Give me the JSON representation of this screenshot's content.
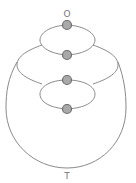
{
  "diagram": {
    "type": "graph",
    "source_label": "O",
    "target_label": "T",
    "nodes": [
      {
        "id": "n1",
        "x": 67,
        "y": 25
      },
      {
        "id": "n2",
        "x": 67,
        "y": 55
      },
      {
        "id": "n3",
        "x": 67,
        "y": 80
      },
      {
        "id": "n4",
        "x": 67,
        "y": 109
      }
    ],
    "edges": [
      {
        "from": "n1",
        "to": "n2",
        "shape": "upper-ellipse-left"
      },
      {
        "from": "n1",
        "to": "n2",
        "shape": "upper-ellipse-right"
      },
      {
        "from": "n1",
        "to": "n3",
        "shape": "middle-lobe-left"
      },
      {
        "from": "n1",
        "to": "n3",
        "shape": "middle-lobe-right"
      },
      {
        "from": "n3",
        "to": "n4",
        "shape": "lower-ellipse-left"
      },
      {
        "from": "n3",
        "to": "n4",
        "shape": "lower-ellipse-right"
      },
      {
        "from": "n1",
        "to": "target",
        "shape": "outer-arc"
      }
    ],
    "colors": {
      "node_fill": "#a9a9a9",
      "node_stroke": "#6d6d6d",
      "edge": "#8a8a8a",
      "label": "#777777"
    }
  }
}
